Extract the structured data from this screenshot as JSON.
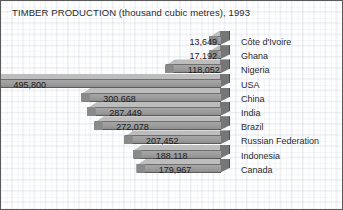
{
  "chart_data": {
    "type": "bar",
    "orientation": "horizontal",
    "title": "TIMBER PRODUCTION (thousand cubic metres), 1993",
    "xlabel": "",
    "ylabel": "",
    "unit": "thousand cubic metres",
    "year": "1993",
    "grid": true,
    "legend": "none",
    "xlim": [
      0,
      495800
    ],
    "categories": [
      "Côte d'Ivoire",
      "Ghana",
      "Nigeria",
      "USA",
      "China",
      "India",
      "Brazil",
      "Russian Federation",
      "Indonesia",
      "Canada"
    ],
    "values": [
      13649,
      17192,
      118052,
      495800,
      300668,
      287449,
      272078,
      207452,
      188118,
      179967
    ],
    "value_labels": [
      "13,649",
      "17,192",
      "118,052",
      "495,800",
      "300,668",
      "287,449",
      "272,078",
      "207,452",
      "188,118",
      "179,967"
    ]
  },
  "style": {
    "bar_face": "#9c9c9c",
    "bar_top": "#bdbdbd",
    "bar_side": "#767676",
    "background": "#ffffff",
    "grid_color": "#96a5be",
    "border": "#5a5a5a",
    "text": "#2b2b2b"
  }
}
